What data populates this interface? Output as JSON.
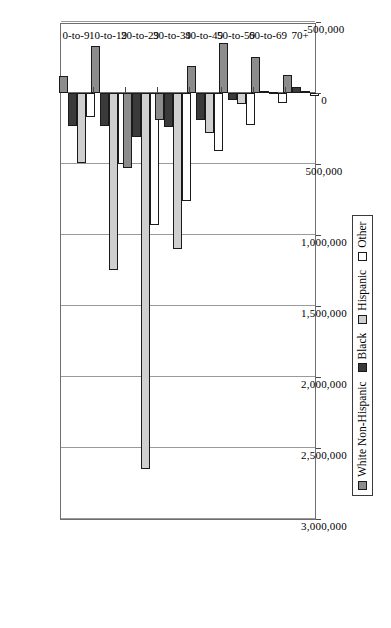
{
  "chart_data": {
    "type": "bar",
    "orientation": "vertical-rotated",
    "title": "",
    "subtitle": "",
    "xlabel": "",
    "ylabel": "",
    "grid": true,
    "legend_position": "bottom",
    "categories": [
      "0-to-9",
      "10-to-19",
      "20-to-29",
      "30-to-39",
      "40-to-49",
      "50-to-59",
      "60-to-69",
      "70+"
    ],
    "ylim": [
      -500000,
      3000000
    ],
    "ytick_labels": [
      "3,000,000",
      "2,500,000",
      "2,000,000",
      "1,500,000",
      "1,000,000",
      "500,000",
      "0",
      "-500,000"
    ],
    "ytick_values": [
      3000000,
      2500000,
      2000000,
      1500000,
      1000000,
      500000,
      0,
      -500000
    ],
    "series": [
      {
        "name": "White Non-Hispanic",
        "color": "#8c8c8c",
        "values": [
          -120000,
          -330000,
          530000,
          190000,
          -190000,
          -350000,
          -250000,
          -130000
        ]
      },
      {
        "name": "Black",
        "color": "#3a3a3a",
        "values": [
          230000,
          230000,
          310000,
          240000,
          190000,
          50000,
          -15000,
          -40000
        ]
      },
      {
        "name": "Hispanic",
        "color": "#cfcfcf",
        "values": [
          490000,
          1250000,
          2650000,
          1100000,
          280000,
          75000,
          10000,
          -5000
        ]
      },
      {
        "name": "Other",
        "color": "#ffffff",
        "values": [
          170000,
          500000,
          930000,
          760000,
          410000,
          225000,
          70000,
          20000
        ]
      }
    ]
  },
  "legend": {
    "entries": [
      {
        "label": "White Non-Hispanic",
        "swatch": "#8c8c8c"
      },
      {
        "label": "Black",
        "swatch": "#3a3a3a"
      },
      {
        "label": "Hispanic",
        "swatch": "#cfcfcf"
      },
      {
        "label": "Other",
        "swatch": "#ffffff"
      }
    ]
  }
}
